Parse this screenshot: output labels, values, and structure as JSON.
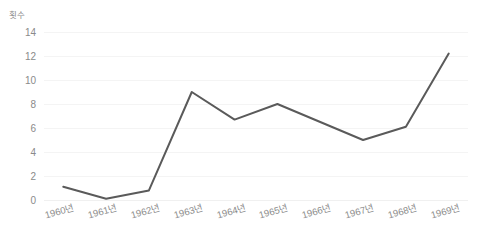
{
  "chart_data": {
    "type": "line",
    "title": "",
    "subtitle": "",
    "xlabel": "",
    "ylabel": "횟수",
    "categories": [
      "1960년",
      "1961년",
      "1962년",
      "1963년",
      "1964년",
      "1965년",
      "1966년",
      "1967년",
      "1968년",
      "1969년"
    ],
    "values": [
      1.1,
      0.1,
      0.8,
      9.0,
      6.7,
      8.0,
      6.5,
      5.0,
      6.1,
      12.2
    ],
    "series": [
      {
        "name": "횟수",
        "values": [
          1.1,
          0.1,
          0.8,
          9.0,
          6.7,
          8.0,
          6.5,
          5.0,
          6.1,
          12.2
        ]
      }
    ],
    "yticks": [
      0,
      2,
      4,
      6,
      8,
      10,
      12,
      14
    ],
    "ytick_labels": [
      "0",
      "2",
      "4",
      "6",
      "8",
      "10",
      "12",
      "14"
    ],
    "ylim": [
      0,
      14
    ],
    "grid": true,
    "grid_axis": "y",
    "legend": false,
    "legend_position": "none",
    "markers": false,
    "line_color": "#5a5a5a",
    "grid_color": "#f4f4f4",
    "text_color": "#8a8a8a",
    "background_color": "#ffffff"
  }
}
